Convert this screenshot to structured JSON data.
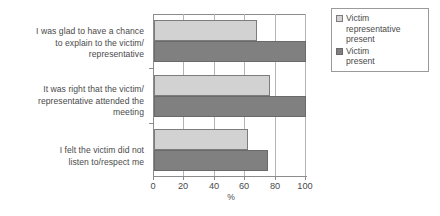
{
  "chart_data": {
    "type": "bar",
    "orientation": "horizontal",
    "title": "",
    "xlabel": "%",
    "ylabel": "",
    "xlim": [
      0,
      100
    ],
    "xticks": [
      0,
      20,
      40,
      60,
      80,
      100
    ],
    "xticklabels": [
      "0",
      "20",
      "40",
      "60",
      "80",
      "100"
    ],
    "grid": true,
    "legend_position": "right",
    "categories": [
      "I was glad to have a chance to explain to the victim/ representative",
      "It was right that the victim/ representative attended the meeting",
      "I felt the victim did not listen to/respect me"
    ],
    "category_lines": [
      [
        "I was glad to have a chance",
        "to explain to the victim/",
        "representative"
      ],
      [
        "It was right that the victim/",
        "representative attended the",
        "meeting"
      ],
      [
        "I felt the victim did not",
        "listen to/respect me"
      ]
    ],
    "series": [
      {
        "name": "Victim representative present",
        "name_lines": [
          "Victim",
          "representative",
          "present"
        ],
        "color": "#d2d2d2",
        "values": [
          68,
          76,
          62
        ]
      },
      {
        "name": "Victim present",
        "name_lines": [
          "Victim",
          "present"
        ],
        "color": "#808080",
        "values": [
          100,
          100,
          75
        ]
      }
    ]
  }
}
